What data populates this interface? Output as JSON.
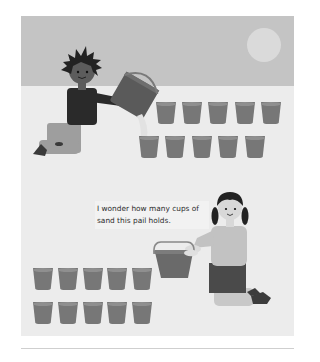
{
  "illustration": {
    "style": "grayscale",
    "scene_top": {
      "description": "Boy kneeling and pouring sand from a pail into cups",
      "cups_row_1_count": 5,
      "cups_row_2_count": 5
    },
    "scene_bottom": {
      "description": "Girl kneeling and holding a pail next to two rows of cups",
      "cups_row_1_count": 5,
      "cups_row_2_count": 5
    },
    "caption": "I wonder how many cups of sand this pail holds.",
    "colors": {
      "sky": "#c4c4c4",
      "ground": "#ececec",
      "sun": "#dadada",
      "cup": "#777777",
      "text": "#2c2c2c"
    }
  }
}
